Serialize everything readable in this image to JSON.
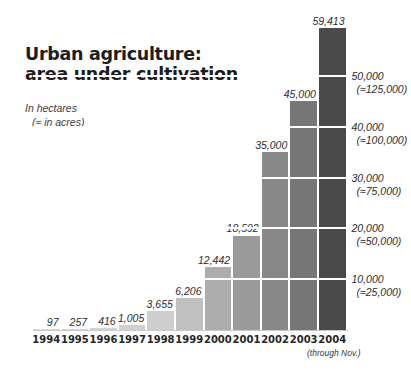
{
  "title": {
    "line1": "Urban agriculture:",
    "line2": "area under cultivation"
  },
  "units": {
    "line1": "In hectares",
    "line2": "(≈ in acres)"
  },
  "footnote": "(through Nov.)",
  "colors": {
    "background": "#ffffff",
    "text": "#1d1d1d",
    "label_text": "#2e2e2e",
    "gridline": "#ffffff",
    "axis_rule": "#c9c9c9"
  },
  "chart_data": {
    "type": "bar",
    "title": "Urban agriculture: area under cultivation",
    "subtitle": "In hectares (≈ in acres)",
    "xlabel": "",
    "ylabel": "In hectares",
    "ylim": [
      0,
      59413
    ],
    "grid": true,
    "legend": "none",
    "categories": [
      "1994",
      "1995",
      "1996",
      "1997",
      "1998",
      "1999",
      "2000",
      "2001",
      "2002",
      "2003",
      "2004"
    ],
    "values": [
      97,
      257,
      416,
      1005,
      3655,
      6206,
      12442,
      18592,
      35000,
      45000,
      59413
    ],
    "value_labels": [
      "97",
      "257",
      "416",
      "1,005",
      "3,655",
      "6,206",
      "12,442",
      "18,592",
      "35,000",
      "45,000",
      "59,413"
    ],
    "bar_colors": [
      "#d9d9d9",
      "#d6d6d6",
      "#d3d3d3",
      "#d0d0d0",
      "#cecece",
      "#c0c0c0",
      "#adadad",
      "#9a9a9a",
      "#888888",
      "#767676",
      "#4a4a4a"
    ],
    "annotations": [
      "2004 (through Nov.)"
    ],
    "yticks": [
      10000,
      20000,
      30000,
      40000,
      50000
    ],
    "ytick_labels": [
      "10,000",
      "20,000",
      "30,000",
      "40,000",
      "50,000"
    ],
    "ytick_sublabels": [
      "(≈25,000)",
      "(≈50,000)",
      "(≈75,000)",
      "(≈100,000)",
      "(≈125,000)"
    ]
  }
}
